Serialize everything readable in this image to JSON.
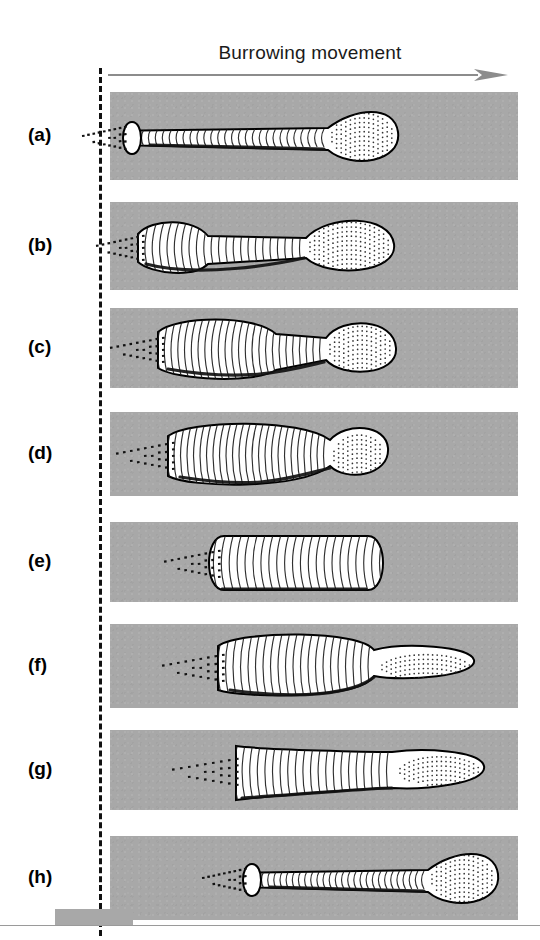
{
  "figure": {
    "title": "Burrowing movement",
    "arrow_icon": "right-arrow-icon",
    "arrow_color": "#8c8c8c",
    "reference_line_icon": "dashed-reference-line",
    "sediment_color": "#a8a8a8",
    "organism_fill": "#ffffff",
    "organism_outline": "#000000",
    "callout": {
      "label": "Proboscis",
      "leader_icon": "leader-line-icon"
    },
    "footer": {
      "scale_bar_icon": "scale-bar",
      "rule_icon": "horizontal-rule"
    }
  },
  "chart_data": {
    "type": "diagram",
    "title": "Burrowing movement",
    "annotations": [
      "Burrowing movement",
      "Proboscis"
    ],
    "stages": [
      {
        "label": "(a)",
        "description": "Body fully extended; proboscis bulbous at far right, collar flange behind head, tail bristles at left.",
        "band": {
          "x": 110,
          "y": 92,
          "width": 408,
          "height": 88
        },
        "body_left": 118,
        "body_right": 400,
        "state": "extended"
      },
      {
        "label": "(b)",
        "description": "Anterior trunk swollen; proboscis retracted into rounded bulb; body shortened.",
        "band": {
          "x": 110,
          "y": 202,
          "width": 408,
          "height": 88
        },
        "body_left": 138,
        "body_right": 398,
        "state": "anterior-swollen"
      },
      {
        "label": "(c)",
        "description": "Trunk strongly swollen and shifted forward; proboscis a compact sphere.",
        "band": {
          "x": 110,
          "y": 308,
          "width": 408,
          "height": 80
        },
        "body_left": 158,
        "body_right": 400,
        "state": "trunk-swollen"
      },
      {
        "label": "(d)",
        "description": "Trunk maximally dilated as anchor; proboscis small and flared.",
        "band": {
          "x": 110,
          "y": 412,
          "width": 408,
          "height": 84
        },
        "body_left": 168,
        "body_right": 392,
        "state": "anchored"
      },
      {
        "label": "(e)",
        "description": "Body fully contracted into a short thick cylinder; proboscis withdrawn.",
        "band": {
          "x": 110,
          "y": 522,
          "width": 408,
          "height": 80
        },
        "body_left": 208,
        "body_right": 390,
        "state": "contracted"
      },
      {
        "label": "(f)",
        "description": "Proboscis thrusts forward from the dilated trunk, probing the sediment ahead.",
        "band": {
          "x": 110,
          "y": 624,
          "width": 408,
          "height": 84
        },
        "body_left": 218,
        "body_right": 478,
        "state": "proboscis-thrust"
      },
      {
        "label": "(g)",
        "description": "Trunk elongating forward behind the everted proboscis.",
        "band": {
          "x": 110,
          "y": 730,
          "width": 408,
          "height": 80
        },
        "body_left": 228,
        "body_right": 488,
        "state": "elongating"
      },
      {
        "label": "(h)",
        "description": "Cycle complete: body again fully extended, advanced to the right of the start line.",
        "band": {
          "x": 110,
          "y": 836,
          "width": 408,
          "height": 84
        },
        "body_left": 238,
        "body_right": 500,
        "state": "extended-advanced"
      }
    ],
    "start_reference_x": 101,
    "movement_direction": "left-to-right"
  }
}
